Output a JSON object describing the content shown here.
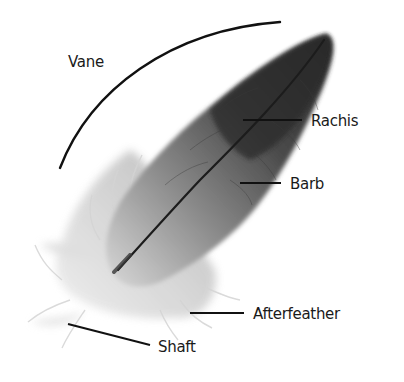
{
  "diagram": {
    "subject": "feather",
    "colors": {
      "background": "#ffffff",
      "line": "#111111",
      "text": "#1a1a1a",
      "feather_dark": "#2e2e2e",
      "feather_mid": "#6f6f6f",
      "feather_light": "#cfcfcf"
    },
    "labels": [
      {
        "id": "vane",
        "text": "Vane",
        "x": 68,
        "y": 62
      },
      {
        "id": "rachis",
        "text": "Rachis",
        "x": 311,
        "y": 121
      },
      {
        "id": "barb",
        "text": "Barb",
        "x": 290,
        "y": 184
      },
      {
        "id": "afterfeather",
        "text": "Afterfeather",
        "x": 253,
        "y": 314
      },
      {
        "id": "shaft",
        "text": "Shaft",
        "x": 158,
        "y": 347
      }
    ]
  }
}
